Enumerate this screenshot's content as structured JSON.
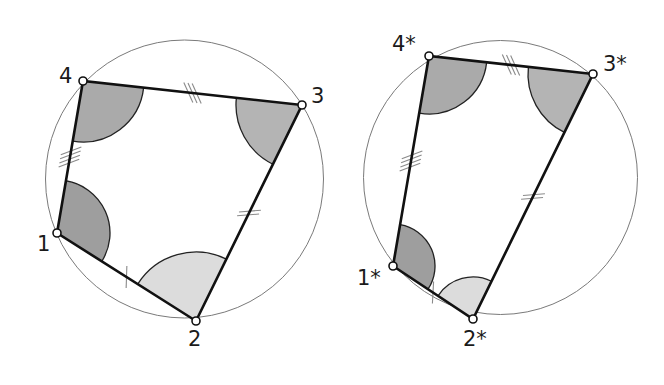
{
  "figures": [
    {
      "id": "original",
      "circle": {
        "cx": 184.5,
        "cy": 179,
        "r": 139
      },
      "vertices": [
        {
          "id": "1",
          "label": "1",
          "x": 57,
          "y": 233,
          "label_x": 37,
          "label_y": 234
        },
        {
          "id": "2",
          "label": "2",
          "x": 196,
          "y": 321,
          "label_x": 188,
          "label_y": 329
        },
        {
          "id": "3",
          "label": "3",
          "x": 302,
          "y": 105,
          "label_x": 311,
          "label_y": 86
        },
        {
          "id": "4",
          "label": "4",
          "x": 83,
          "y": 81,
          "label_x": 59,
          "label_y": 66
        }
      ],
      "angles": [
        {
          "at": "1",
          "radius": 53,
          "fill": "#9e9e9e"
        },
        {
          "at": "2",
          "radius": 69,
          "fill": "#dcdcdc"
        },
        {
          "at": "3",
          "radius": 66,
          "fill": "#b4b4b4"
        },
        {
          "at": "4",
          "radius": 61,
          "fill": "#aaaaaa"
        }
      ],
      "sides": [
        {
          "from": "1",
          "to": "2",
          "ticks": 1,
          "t": 0.5
        },
        {
          "from": "2",
          "to": "3",
          "ticks": 2,
          "t": 0.5
        },
        {
          "from": "3",
          "to": "4",
          "ticks": 3,
          "t": 0.5
        },
        {
          "from": "4",
          "to": "1",
          "ticks": 4,
          "t": 0.5
        }
      ]
    },
    {
      "id": "transformed",
      "circle": {
        "cx": 500.5,
        "cy": 177.5,
        "r": 137
      },
      "vertices": [
        {
          "id": "1",
          "label": "1*",
          "x": 393,
          "y": 266,
          "label_x": 357,
          "label_y": 268
        },
        {
          "id": "2",
          "label": "2*",
          "x": 473,
          "y": 319,
          "label_x": 463,
          "label_y": 329
        },
        {
          "id": "3",
          "label": "3*",
          "x": 593,
          "y": 74,
          "label_x": 603,
          "label_y": 54
        },
        {
          "id": "4",
          "label": "4*",
          "x": 429,
          "y": 56,
          "label_x": 392,
          "label_y": 34
        }
      ],
      "angles": [
        {
          "at": "1",
          "radius": 42,
          "fill": "#9e9e9e"
        },
        {
          "at": "2",
          "radius": 42,
          "fill": "#dcdcdc"
        },
        {
          "at": "3",
          "radius": 65,
          "fill": "#b4b4b4"
        },
        {
          "at": "4",
          "radius": 58,
          "fill": "#aaaaaa"
        }
      ],
      "sides": [
        {
          "from": "1",
          "to": "2",
          "ticks": 1,
          "t": 0.5
        },
        {
          "from": "2",
          "to": "3",
          "ticks": 2,
          "t": 0.5
        },
        {
          "from": "3",
          "to": "4",
          "ticks": 3,
          "t": 0.5
        },
        {
          "from": "4",
          "to": "1",
          "ticks": 4,
          "t": 0.5
        }
      ]
    }
  ],
  "style": {
    "circle_stroke": "#7a7a7a",
    "edge_stroke": "#111111",
    "tick_stroke": "#8a8a8a",
    "arc_stroke": "#222222",
    "vertex_fill": "#ffffff",
    "vertex_stroke": "#111111"
  }
}
